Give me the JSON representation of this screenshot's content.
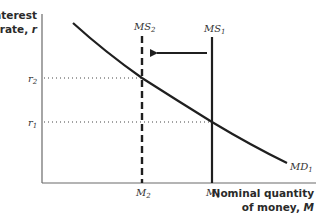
{
  "diagram": {
    "type": "money-market-supply-demand",
    "y_axis": {
      "title_line1": "Interest",
      "title_line2": "rate, ",
      "title_var": "r"
    },
    "x_axis": {
      "title_line1": "Nominal quantity",
      "title_line2": "of money, ",
      "title_var": "M"
    },
    "curves": {
      "md1": {
        "label": "MD",
        "sub": "1"
      },
      "ms1": {
        "label": "MS",
        "sub": "1",
        "style": "solid"
      },
      "ms2": {
        "label": "MS",
        "sub": "2",
        "style": "dashed"
      }
    },
    "y_ticks": {
      "r2": {
        "label": "r",
        "sub": "2"
      },
      "r1": {
        "label": "r",
        "sub": "1"
      }
    },
    "x_ticks": {
      "m2": {
        "label": "M",
        "sub": "2"
      },
      "m1": {
        "label": "M",
        "sub": "1"
      }
    },
    "shift_arrow": {
      "from": "MS1",
      "to": "MS2",
      "direction": "left"
    },
    "colors": {
      "line": "#1f1f1f",
      "axis": "#555555",
      "text": "#2a2a2a"
    }
  }
}
